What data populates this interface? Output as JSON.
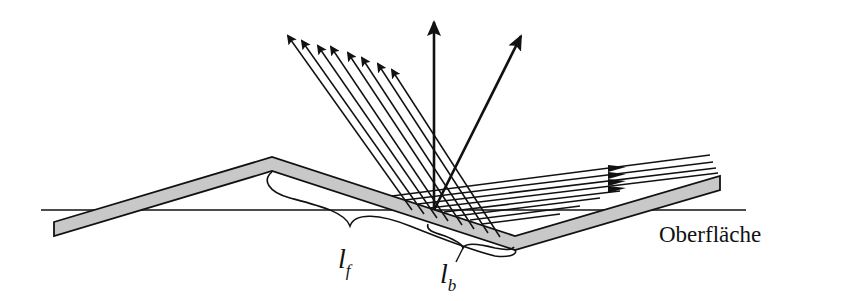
{
  "diagram": {
    "labels": {
      "surface": "Oberfläche",
      "lf_main": "l",
      "lf_sub": "f",
      "lb_main": "l",
      "lb_sub": "b"
    },
    "colors": {
      "stroke": "#111111",
      "surface_fill": "#c8c8c8",
      "background": "#ffffff"
    },
    "elements": {
      "incident_ray_count": 8,
      "reflected_ray_count": 8,
      "vertical_arrow": true,
      "oblique_arrow": true
    }
  }
}
